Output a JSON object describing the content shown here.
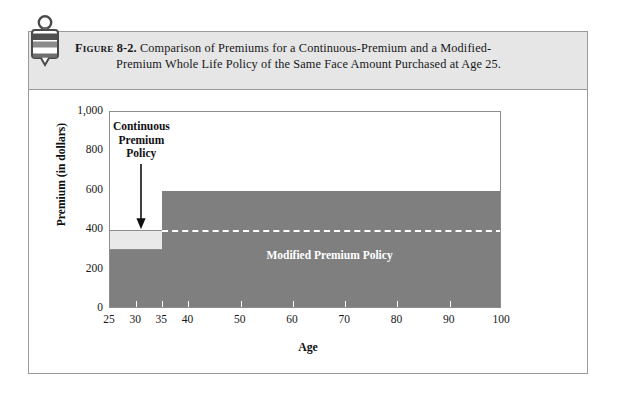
{
  "figure": {
    "icon_name": "figure-tag-icon",
    "label": "Figure",
    "number": "8-2.",
    "caption_line1": "Comparison of Premiums for a Continuous-Premium and a Modified-",
    "caption_line2": "Premium Whole Life Policy of the Same Face Amount Purchased at Age 25."
  },
  "colors": {
    "band_background": "#e6e6e6",
    "frame_border": "#9a9a9a",
    "modified_fill": "#7f7f7f",
    "continuous_band_fill": "#e9e9e9",
    "dashed_line": "#ffffff",
    "text": "#17171a"
  },
  "chart_data": {
    "type": "area",
    "xlabel": "Age",
    "ylabel": "Premium (in dollars)",
    "xlim": [
      25,
      100
    ],
    "ylim": [
      0,
      1000
    ],
    "grid": false,
    "legend": "none",
    "x_ticks": [
      25,
      30,
      35,
      40,
      50,
      60,
      70,
      80,
      90,
      100
    ],
    "x_tick_labels": [
      "25",
      "30",
      "35",
      "40",
      "50",
      "60",
      "70",
      "80",
      "90",
      "100"
    ],
    "y_ticks": [
      0,
      200,
      400,
      600,
      800,
      1000
    ],
    "y_tick_labels": [
      "0",
      "200",
      "400",
      "600",
      "800",
      "1,000"
    ],
    "series": [
      {
        "name": "Modified Premium Policy",
        "style": "dark-gray-filled-step",
        "steps": [
          {
            "x_start": 25,
            "x_end": 35,
            "value": 300
          },
          {
            "x_start": 35,
            "x_end": 100,
            "value": 600
          }
        ]
      },
      {
        "name": "Continuous Premium Policy",
        "style": "light-gray-band",
        "steps": [
          {
            "x_start": 25,
            "x_end": 35,
            "value_low": 300,
            "value_high": 400
          }
        ]
      },
      {
        "name": "Continuous premium level reference",
        "style": "white-dashed-line",
        "value": 400,
        "x_start": 35,
        "x_end": 100
      }
    ],
    "annotations": [
      {
        "name": "continuous-premium-callout",
        "text_lines": [
          "Continuous",
          "Premium",
          "Policy"
        ],
        "arrow": "down-arrow",
        "points_to_x": 31,
        "points_to_y": 400
      },
      {
        "name": "modified-premium-inline-label",
        "text": "Modified Premium Policy",
        "at_x": 67,
        "at_y": 270
      }
    ]
  }
}
